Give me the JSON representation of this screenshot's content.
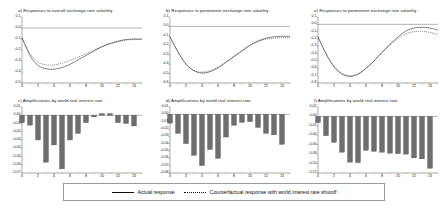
{
  "figure": {
    "background": "#ffffff",
    "line_color": "#333333",
    "bar_color": "#6e6e6e",
    "axis_color": "#555555"
  },
  "legend": {
    "actual_label": "Actual response",
    "counterfactual_label": "Counterfactual response with world interest rate shutoff"
  },
  "chart_data": [
    {
      "id": "a",
      "type": "line",
      "title": "a) Responses to overall exchange rate volatility",
      "xlabel": "",
      "ylabel": "",
      "xlim": [
        0,
        15
      ],
      "ylim": [
        -0.5,
        0.1
      ],
      "xticks": [
        0,
        2,
        4,
        6,
        8,
        10,
        12,
        14
      ],
      "yticks": [
        "0.1",
        "0.0",
        "-0.1",
        "-0.2",
        "-0.3",
        "-0.4",
        "-0.5"
      ],
      "grid": false,
      "zero_line": true,
      "x": [
        0,
        1,
        2,
        3,
        4,
        5,
        6,
        7,
        8,
        9,
        10,
        11,
        12,
        13,
        14,
        15
      ],
      "series": [
        {
          "name": "Actual response",
          "style": "solid",
          "values": [
            -0.09,
            -0.25,
            -0.34,
            -0.37,
            -0.375,
            -0.36,
            -0.33,
            -0.29,
            -0.25,
            -0.21,
            -0.17,
            -0.14,
            -0.12,
            -0.105,
            -0.1,
            -0.1
          ]
        },
        {
          "name": "Counterfactual response with world interest rate shutoff",
          "style": "dotted",
          "values": [
            -0.09,
            -0.23,
            -0.31,
            -0.335,
            -0.335,
            -0.32,
            -0.295,
            -0.265,
            -0.235,
            -0.2,
            -0.17,
            -0.145,
            -0.125,
            -0.11,
            -0.105,
            -0.105
          ]
        }
      ]
    },
    {
      "id": "b",
      "type": "line",
      "title": "b) Responses to permanent exchange rate volatility",
      "xlabel": "",
      "ylabel": "",
      "xlim": [
        0,
        15
      ],
      "ylim": [
        -0.6,
        0.1
      ],
      "xticks": [
        0,
        2,
        4,
        6,
        8,
        10,
        12,
        14
      ],
      "yticks": [
        "0.1",
        "0.0",
        "-0.1",
        "-0.2",
        "-0.3",
        "-0.4",
        "-0.5",
        "-0.6"
      ],
      "grid": false,
      "zero_line": true,
      "x": [
        0,
        1,
        2,
        3,
        4,
        5,
        6,
        7,
        8,
        9,
        10,
        11,
        12,
        13,
        14,
        15
      ],
      "series": [
        {
          "name": "Actual response",
          "style": "solid",
          "values": [
            -0.11,
            -0.27,
            -0.4,
            -0.47,
            -0.495,
            -0.48,
            -0.44,
            -0.38,
            -0.32,
            -0.26,
            -0.2,
            -0.155,
            -0.125,
            -0.11,
            -0.105,
            -0.105
          ]
        },
        {
          "name": "Counterfactual response with world interest rate shutoff",
          "style": "dotted",
          "values": [
            -0.11,
            -0.27,
            -0.4,
            -0.465,
            -0.485,
            -0.47,
            -0.43,
            -0.375,
            -0.315,
            -0.255,
            -0.2,
            -0.16,
            -0.135,
            -0.125,
            -0.12,
            -0.12
          ]
        }
      ]
    },
    {
      "id": "e",
      "type": "line",
      "title": "e) Responses to permanent exchange rate volatility",
      "xlabel": "",
      "ylabel": "",
      "xlim": [
        0,
        15
      ],
      "ylim": [
        -0.8,
        0.1
      ],
      "xticks": [
        0,
        2,
        4,
        6,
        8,
        10,
        12,
        14
      ],
      "yticks": [
        "0.1",
        "0.0",
        "-0.1",
        "-0.2",
        "-0.3",
        "-0.4",
        "-0.5",
        "-0.6",
        "-0.7",
        "-0.8"
      ],
      "grid": false,
      "zero_line": true,
      "x": [
        0,
        1,
        2,
        3,
        4,
        5,
        6,
        7,
        8,
        9,
        10,
        11,
        12,
        13,
        14,
        15
      ],
      "series": [
        {
          "name": "Actual response",
          "style": "solid",
          "values": [
            -0.17,
            -0.4,
            -0.58,
            -0.68,
            -0.71,
            -0.68,
            -0.6,
            -0.5,
            -0.38,
            -0.27,
            -0.17,
            -0.09,
            -0.05,
            -0.04,
            -0.05,
            -0.08
          ]
        },
        {
          "name": "Counterfactual response with world interest rate shutoff",
          "style": "dotted",
          "values": [
            -0.17,
            -0.4,
            -0.57,
            -0.665,
            -0.7,
            -0.675,
            -0.6,
            -0.5,
            -0.39,
            -0.285,
            -0.195,
            -0.13,
            -0.1,
            -0.095,
            -0.11,
            -0.14
          ]
        }
      ]
    },
    {
      "id": "c",
      "type": "bar",
      "title": "c) Amplifications by world real interest rate",
      "xlabel": "",
      "ylabel": "",
      "xlim": [
        0,
        15
      ],
      "ylim": [
        -0.07,
        0.01
      ],
      "xticks": [
        0,
        2,
        4,
        6,
        8,
        10,
        12,
        14
      ],
      "yticks": [
        "0.01",
        "0.00",
        "-0.01",
        "-0.02",
        "-0.03",
        "-0.04",
        "-0.05",
        "-0.06",
        "-0.07"
      ],
      "grid": false,
      "zero_line": true,
      "categories": [
        0,
        1,
        2,
        3,
        4,
        5,
        6,
        7,
        8,
        9,
        10,
        11,
        12,
        13,
        14
      ],
      "values": [
        -0.009,
        -0.012,
        -0.03,
        -0.057,
        -0.036,
        -0.065,
        -0.03,
        -0.022,
        -0.009,
        -0.002,
        0.002,
        0.002,
        -0.009,
        -0.01,
        -0.013
      ]
    },
    {
      "id": "d",
      "type": "bar",
      "title": "d) Amplifications by world real interest rate",
      "xlabel": "",
      "ylabel": "",
      "xlim": [
        0,
        15
      ],
      "ylim": [
        -0.08,
        0.01
      ],
      "xticks": [
        0,
        2,
        4,
        6,
        8,
        10,
        12,
        14
      ],
      "yticks": [
        "0.01",
        "0.00",
        "-0.01",
        "-0.02",
        "-0.03",
        "-0.04",
        "-0.05",
        "-0.06",
        "-0.07",
        "-0.08"
      ],
      "grid": false,
      "zero_line": true,
      "categories": [
        0,
        1,
        2,
        3,
        4,
        5,
        6,
        7,
        8,
        9,
        10,
        11,
        12,
        13,
        14
      ],
      "values": [
        -0.012,
        -0.026,
        -0.04,
        -0.056,
        -0.07,
        -0.048,
        -0.06,
        -0.031,
        -0.015,
        -0.011,
        -0.01,
        -0.018,
        -0.026,
        -0.028,
        -0.041
      ]
    },
    {
      "id": "f",
      "type": "bar",
      "title": "f) Amplifications by world real interest rate",
      "xlabel": "",
      "ylabel": "",
      "xlim": [
        0,
        15
      ],
      "ylim": [
        -0.12,
        0.02
      ],
      "xticks": [
        0,
        2,
        4,
        6,
        8,
        10,
        12,
        14
      ],
      "yticks": [
        "0.02",
        "0.00",
        "-0.02",
        "-0.04",
        "-0.06",
        "-0.08",
        "-0.10",
        "-0.12"
      ],
      "grid": false,
      "zero_line": true,
      "categories": [
        0,
        1,
        2,
        3,
        4,
        5,
        6,
        7,
        8,
        9,
        10,
        11,
        12,
        13,
        14
      ],
      "values": [
        -0.013,
        -0.041,
        -0.055,
        -0.076,
        -0.097,
        -0.098,
        -0.072,
        -0.074,
        -0.076,
        -0.078,
        -0.079,
        -0.08,
        -0.088,
        -0.09,
        -0.11
      ]
    }
  ]
}
